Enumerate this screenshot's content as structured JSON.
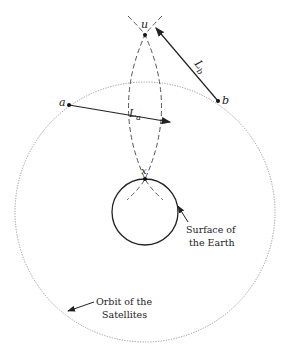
{
  "diagram": {
    "points": {
      "u": {
        "label": "u",
        "x": 145,
        "y": 35
      },
      "a": {
        "label": "a",
        "x": 69,
        "y": 105
      },
      "b": {
        "label": "b",
        "x": 218,
        "y": 101
      },
      "x": {
        "label": "x",
        "x": 145,
        "y": 179
      }
    },
    "vectors": {
      "La": {
        "label": "L",
        "sub": "a"
      },
      "Lb": {
        "label": "L",
        "sub": "b"
      }
    },
    "annotations": {
      "earth_line1": "Surface of",
      "earth_line2": "the Earth",
      "orbit_line1": "Orbit of the",
      "orbit_line2": "Satellites"
    },
    "colors": {
      "ink": "#222222",
      "dashed": "#555555",
      "orbit": "#999999"
    }
  }
}
